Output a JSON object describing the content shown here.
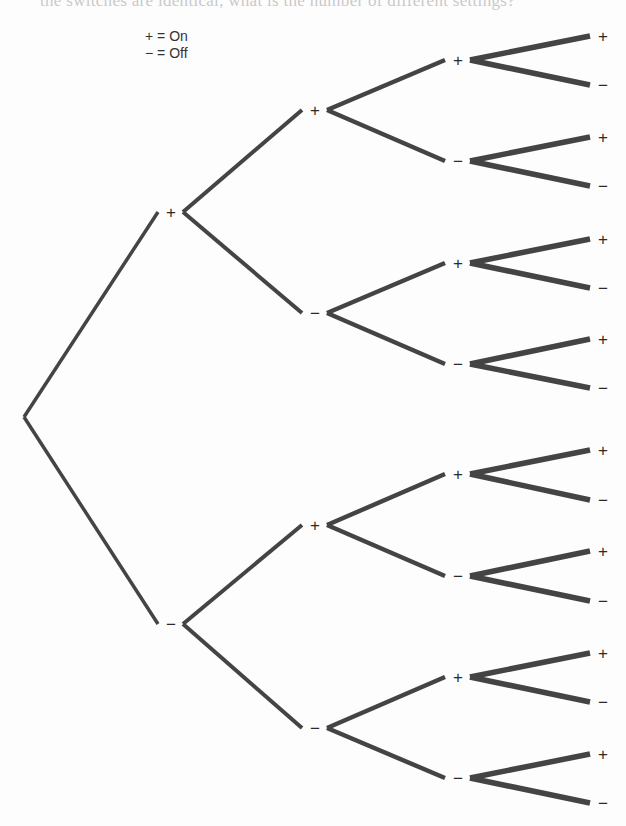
{
  "page": {
    "bleed_through_text": "the switches are identical, what is the number of different settings?"
  },
  "legend": {
    "on": "+ = On",
    "off": "− = Off"
  },
  "symbols": {
    "on": "+",
    "off": "−"
  },
  "colors": {
    "line": "#444444",
    "text": "#2a2a2a",
    "background": "#fdfdfd"
  },
  "tree": {
    "description": "Binary tree diagram of 4 switches, each On (+) or Off (-), producing 16 outcomes",
    "root": {
      "x": 24,
      "y": 417
    },
    "levels": [
      {
        "stroke_width": 3.5,
        "nodes": [
          {
            "label": "+",
            "parent": "root",
            "x": 171,
            "y": 212
          },
          {
            "label": "−",
            "parent": "root",
            "x": 171,
            "y": 624
          }
        ]
      },
      {
        "stroke_width": 4,
        "nodes": [
          {
            "label": "+",
            "parent": 0,
            "x": 315,
            "y": 110
          },
          {
            "label": "−",
            "parent": 0,
            "x": 315,
            "y": 313
          },
          {
            "label": "+",
            "parent": 1,
            "x": 315,
            "y": 525
          },
          {
            "label": "−",
            "parent": 1,
            "x": 315,
            "y": 728
          }
        ]
      },
      {
        "stroke_width": 4.5,
        "nodes": [
          {
            "label": "+",
            "parent": 0,
            "x": 458,
            "y": 60
          },
          {
            "label": "−",
            "parent": 0,
            "x": 458,
            "y": 161
          },
          {
            "label": "+",
            "parent": 1,
            "x": 458,
            "y": 263
          },
          {
            "label": "−",
            "parent": 1,
            "x": 458,
            "y": 364
          },
          {
            "label": "+",
            "parent": 2,
            "x": 458,
            "y": 474
          },
          {
            "label": "−",
            "parent": 2,
            "x": 458,
            "y": 576
          },
          {
            "label": "+",
            "parent": 3,
            "x": 458,
            "y": 677
          },
          {
            "label": "−",
            "parent": 3,
            "x": 458,
            "y": 778
          }
        ]
      },
      {
        "stroke_width": 5.5,
        "nodes": [
          {
            "label": "+",
            "parent": 0,
            "x": 603,
            "y": 36
          },
          {
            "label": "−",
            "parent": 0,
            "x": 603,
            "y": 85
          },
          {
            "label": "+",
            "parent": 1,
            "x": 603,
            "y": 137
          },
          {
            "label": "−",
            "parent": 1,
            "x": 603,
            "y": 186
          },
          {
            "label": "+",
            "parent": 2,
            "x": 603,
            "y": 239
          },
          {
            "label": "−",
            "parent": 2,
            "x": 603,
            "y": 288
          },
          {
            "label": "+",
            "parent": 3,
            "x": 603,
            "y": 339
          },
          {
            "label": "−",
            "parent": 3,
            "x": 603,
            "y": 388
          },
          {
            "label": "+",
            "parent": 4,
            "x": 603,
            "y": 450
          },
          {
            "label": "−",
            "parent": 4,
            "x": 603,
            "y": 500
          },
          {
            "label": "+",
            "parent": 5,
            "x": 603,
            "y": 551
          },
          {
            "label": "−",
            "parent": 5,
            "x": 603,
            "y": 601
          },
          {
            "label": "+",
            "parent": 6,
            "x": 603,
            "y": 653
          },
          {
            "label": "−",
            "parent": 6,
            "x": 603,
            "y": 702
          },
          {
            "label": "+",
            "parent": 7,
            "x": 603,
            "y": 754
          },
          {
            "label": "−",
            "parent": 7,
            "x": 603,
            "y": 803
          }
        ]
      }
    ],
    "label_gap_left": 13,
    "label_gap_right": 12,
    "outcome_count": 16
  }
}
